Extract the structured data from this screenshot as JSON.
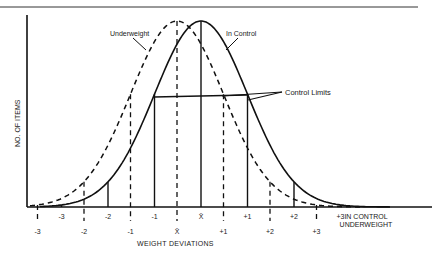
{
  "chart_data": {
    "type": "line",
    "title": "",
    "xlabel": "WEIGHT DEVIATIONS",
    "ylabel": "NO. OF ITEMS",
    "grid": false,
    "series": [
      {
        "name": "In Control",
        "style": "solid",
        "mean_x_px": 201,
        "sigma_px": 46.5,
        "tick_labels": [
          "-3",
          "-2",
          "-1",
          "X̄",
          "+1",
          "+2",
          "+3"
        ],
        "tick_values_sigma": [
          -3,
          -2,
          -1,
          0,
          1,
          2,
          3
        ]
      },
      {
        "name": "Underweight",
        "style": "dashed",
        "mean_x_px": 177,
        "sigma_px": 46.5,
        "tick_labels": [
          "-3",
          "-2",
          "-1",
          "X̄",
          "+1",
          "+2",
          "+3"
        ],
        "tick_values_sigma": [
          -3,
          -2,
          -1,
          0,
          1,
          2,
          3
        ]
      }
    ],
    "annotations": [
      {
        "text": "Underweight",
        "points_to": "dashed curve"
      },
      {
        "text": "In Control",
        "points_to": "solid curve"
      },
      {
        "text": "Control Limits",
        "points_to": "horizontal line between -1 and +1 of In Control"
      }
    ],
    "axis_row_labels": [
      "IN CONTROL",
      "UNDERWEIGHT"
    ],
    "legend_position": "right of x-axis"
  },
  "labels": {
    "underweight": "Underweight",
    "in_control": "In Control",
    "control_limits": "Control Limits",
    "ylabel": "NO. OF ITEMS",
    "xlabel": "WEIGHT DEVIATIONS",
    "row_in_control": "IN CONTROL",
    "row_underweight": "UNDERWEIGHT"
  },
  "ticks": {
    "in_control": [
      "-3",
      "-2",
      "-1",
      "X̄",
      "+1",
      "+2",
      "+3"
    ],
    "underweight": [
      "-3",
      "-2",
      "-1",
      "X̄",
      "+1",
      "+2",
      "+3"
    ]
  }
}
